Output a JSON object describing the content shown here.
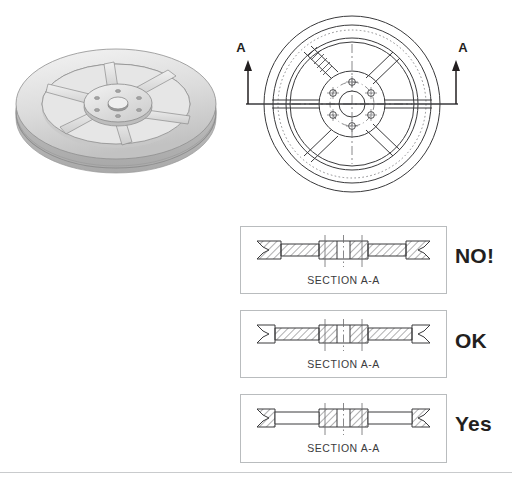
{
  "figure": {
    "background_color": "#ffffff",
    "line_color": "#231f20",
    "box_border_color": "#b9bcbe"
  },
  "pictorial": {
    "label": "3d-pulley-render",
    "description": "Shaded pictorial of a six-spoke V-groove pulley",
    "surface_light": "#f2f2f2",
    "surface_mid": "#d9d9d9",
    "surface_dark": "#b4b4b4",
    "spoke_count": 6,
    "bolt_hole_count": 6
  },
  "front_view": {
    "label": "front-orthographic-view",
    "spoke_count": 6,
    "bolt_hole_count": 6,
    "cutting_plane": {
      "left_label": "A",
      "right_label": "A",
      "arrow_direction": "up"
    }
  },
  "sections": [
    {
      "id": "no",
      "caption": "SECTION A-A",
      "verdict": "NO!",
      "spokes_hatched": true,
      "note": "spokes sectioned with hatching - incorrect"
    },
    {
      "id": "ok",
      "caption": "SECTION A-A",
      "verdict": "OK",
      "spokes_hatched": true,
      "note": "spokes hatched at reduced extent - acceptable"
    },
    {
      "id": "yes",
      "caption": "SECTION A-A",
      "verdict": "Yes",
      "spokes_hatched": false,
      "note": "spokes left unhatched - preferred convention"
    }
  ],
  "footer": {
    "caption": ""
  }
}
